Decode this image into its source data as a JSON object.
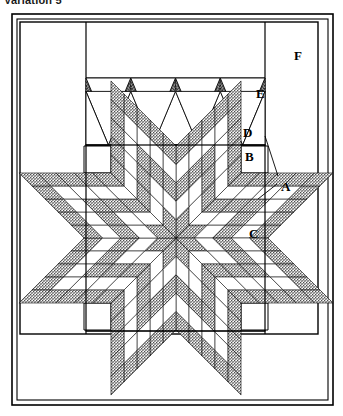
{
  "caption": {
    "text": "Variation 5"
  },
  "figure": {
    "colors": {
      "ink": "#000000",
      "paper": "#ffffff",
      "fabric_light": "#ffffff",
      "fabric_dark": "#9a9a9a",
      "stipple": "#6e6e6e"
    },
    "labels": [
      {
        "id": "A",
        "text": "A",
        "x": 281,
        "y": 180,
        "note": "setting triangle / leader lines to two pieces"
      },
      {
        "id": "B",
        "text": "B",
        "x": 245,
        "y": 150,
        "note": "plain corner square of star block"
      },
      {
        "id": "C",
        "text": "C",
        "x": 249,
        "y": 227,
        "note": "side setting triangle of star block"
      },
      {
        "id": "D",
        "text": "D",
        "x": 243,
        "y": 126,
        "note": "zigzag band lower triangle"
      },
      {
        "id": "E",
        "text": "E",
        "x": 256,
        "y": 87,
        "note": "zigzag band chevron strip"
      },
      {
        "id": "F",
        "text": "F",
        "x": 294,
        "y": 49,
        "note": "outer plain border"
      }
    ],
    "leaders": [
      {
        "from_x": 278,
        "from_y": 176,
        "to_x": 265,
        "to_y": 136
      },
      {
        "from_x": 277,
        "from_y": 184,
        "to_x": 258,
        "to_y": 199
      }
    ],
    "geometry": {
      "outer_frame": {
        "x": 12,
        "y": 14,
        "width": 321,
        "height": 391
      },
      "inner_frame": {
        "x": 17,
        "y": 19,
        "width": 311,
        "height": 381
      },
      "quilt_top": {
        "x": 20,
        "y": 22,
        "width": 298,
        "height": 312
      },
      "left_border_x": 86,
      "right_border_x": 265,
      "center_panel": {
        "x": 86,
        "y": 22,
        "width": 179,
        "height": 312
      },
      "zigzag_band": {
        "x": 86,
        "y": 78,
        "width": 179,
        "height": 67,
        "peaks": 4
      },
      "star_block": {
        "x": 86,
        "y": 145,
        "width": 179,
        "height": 186
      },
      "star": {
        "cx": 176,
        "cy": 238,
        "radius": 92,
        "points": 8,
        "diamonds_per_side": 5
      }
    }
  }
}
